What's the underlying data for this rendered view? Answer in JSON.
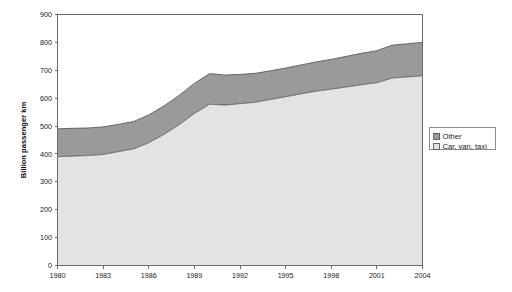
{
  "chart_data": {
    "type": "area",
    "stacked": true,
    "title": "",
    "subtitle": "",
    "xlabel": "",
    "ylabel": "Billion passenger km",
    "x": [
      1980,
      1981,
      1982,
      1983,
      1984,
      1985,
      1986,
      1987,
      1988,
      1989,
      1990,
      1991,
      1992,
      1993,
      1994,
      1995,
      1996,
      1997,
      1998,
      1999,
      2000,
      2001,
      2002,
      2003,
      2004
    ],
    "xlim": [
      1980,
      2004
    ],
    "ylim": [
      0,
      900
    ],
    "xticks": [
      1980,
      1983,
      1986,
      1989,
      1992,
      1995,
      1998,
      2001,
      2004
    ],
    "xtick_labels": [
      "1980",
      "1983",
      "1986",
      "1989",
      "1992",
      "1995",
      "1998",
      "2001",
      "2004"
    ],
    "yticks": [
      0,
      100,
      200,
      300,
      400,
      500,
      600,
      700,
      800,
      900
    ],
    "ytick_labels": [
      "0",
      "100",
      "200",
      "300",
      "400",
      "500",
      "600",
      "700",
      "800",
      "900"
    ],
    "grid": false,
    "legend_position": "right",
    "series": [
      {
        "name": "Car, van, taxi",
        "color": "#e3e3e3",
        "values": [
          390,
          392,
          394,
          398,
          408,
          418,
          440,
          470,
          505,
          545,
          578,
          575,
          580,
          585,
          595,
          605,
          615,
          625,
          632,
          640,
          648,
          655,
          672,
          676,
          680
        ]
      },
      {
        "name": "Other",
        "color": "#9a9a9a",
        "values": [
          100,
          100,
          99,
          99,
          98,
          98,
          100,
          102,
          105,
          108,
          110,
          108,
          105,
          104,
          103,
          103,
          104,
          105,
          107,
          110,
          113,
          115,
          118,
          119,
          120
        ]
      }
    ],
    "totals": [
      490,
      492,
      493,
      497,
      506,
      516,
      540,
      572,
      610,
      653,
      688,
      683,
      685,
      689,
      698,
      708,
      719,
      730,
      739,
      750,
      761,
      770,
      790,
      795,
      800
    ]
  },
  "legend": {
    "entries": [
      {
        "label": "Other",
        "color": "#9a9a9a"
      },
      {
        "label": "Car, van, taxi",
        "color": "#e3e3e3"
      }
    ]
  },
  "axes": {
    "y_title": "Billion passenger km"
  }
}
